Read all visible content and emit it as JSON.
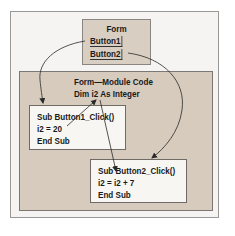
{
  "form": {
    "title": "Form",
    "buttons": [
      {
        "label": "Button1"
      },
      {
        "label": "Button2"
      }
    ]
  },
  "module": {
    "title": "Form—Module Code",
    "declaration": "Dim i2 As Integer"
  },
  "subs": [
    {
      "lines": [
        "Sub Button1_Click()",
        "i2 = 20",
        "End Sub"
      ]
    },
    {
      "lines": [
        "Sub Button2_Click()",
        "i2 = i2 + 7",
        "End Sub"
      ]
    }
  ],
  "colors": {
    "outer_bg": "#f5f4f2",
    "form_fill": "#d8cec1",
    "module_fill": "#d6cbbd",
    "sub_fill": "#f7f6f3",
    "line": "#2a2a2a"
  },
  "arrows": [
    {
      "from": "Button1",
      "to": "Sub Button1_Click()"
    },
    {
      "from": "Button2",
      "to": "Sub Button2_Click()"
    },
    {
      "from": "i2 = 20",
      "to": "Dim i2 As Integer"
    },
    {
      "from": "Dim i2 As Integer",
      "to": "Sub Button2_Click()"
    }
  ]
}
